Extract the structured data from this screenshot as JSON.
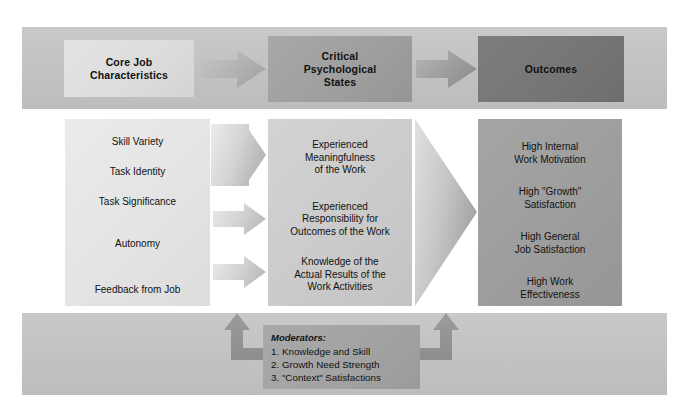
{
  "diagram": {
    "colors": {
      "band": "#c4c4c4",
      "core_header": "#dcdcdc",
      "states_header": "#9e9e9e",
      "outcomes_header": "#757575",
      "core_column": "#e4e4e4",
      "states_column": "#cbcbcb",
      "outcomes_column": "#9d9d9d",
      "moderators_box": "#a2a2a2",
      "arrow_light": "#d9d9d9",
      "arrow_mid": "#b9b9b9",
      "arrow_dark": "#9a9a9a",
      "text": "#111111"
    }
  },
  "headers": [
    {
      "id": "core",
      "label": "Core Job\nCharacteristics",
      "lines": [
        "Core Job",
        "Characteristics"
      ]
    },
    {
      "id": "critical",
      "label": "Critical Psychological States",
      "lines": [
        "Critical",
        "Psychological",
        "States"
      ]
    },
    {
      "id": "outcomes",
      "label": "Outcomes",
      "lines": [
        "Outcomes"
      ]
    }
  ],
  "core_job_characteristics": {
    "items": [
      {
        "label": "Skill Variety"
      },
      {
        "label": "Task Identity"
      },
      {
        "label": "Task Significance"
      },
      {
        "label": "Autonomy"
      },
      {
        "label": "Feedback from Job"
      }
    ]
  },
  "critical_psychological_states": {
    "items": [
      {
        "lines": [
          "Experienced",
          "Meaningfulness",
          "of the Work"
        ]
      },
      {
        "lines": [
          "Experienced",
          "Responsibility for",
          "Outcomes of the Work"
        ]
      },
      {
        "lines": [
          "Knowledge of the",
          "Actual Results of the",
          "Work Activities"
        ]
      }
    ]
  },
  "outcomes": {
    "items": [
      {
        "lines": [
          "High Internal",
          "Work Motivation"
        ]
      },
      {
        "lines": [
          "High \"Growth\"",
          "Satisfaction"
        ]
      },
      {
        "lines": [
          "High General",
          "Job Satisfaction"
        ]
      },
      {
        "lines": [
          "High Work",
          "Effectiveness"
        ]
      }
    ]
  },
  "moderators": {
    "title": "Moderators:",
    "items": [
      "1. Knowledge and Skill",
      "2. Growth Need Strength",
      "3. \"Context\" Satisfactions"
    ]
  },
  "arrows": {
    "header_core_to_states": "arrow-right",
    "header_states_to_outcomes": "arrow-right",
    "converge_three_to_meaningfulness": "wedge-arrow-right",
    "autonomy_to_responsibility": "arrow-right",
    "feedback_to_knowledge": "arrow-right",
    "states_to_outcomes": "large-chevron-right",
    "moderator_left": "elbow-arrow-up",
    "moderator_right": "elbow-arrow-up"
  }
}
